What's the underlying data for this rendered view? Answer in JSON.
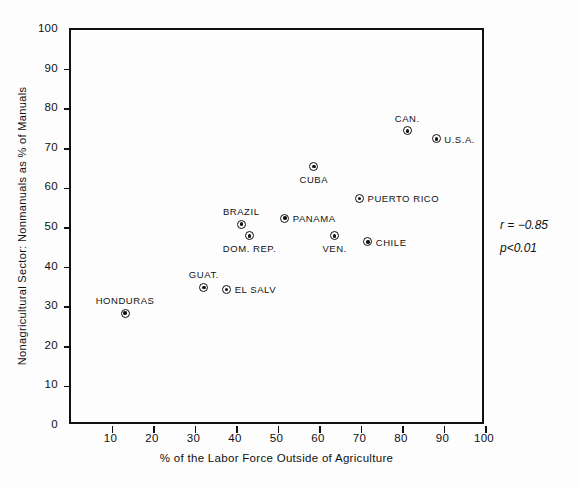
{
  "chart_data": {
    "type": "scatter",
    "title": "",
    "xlabel": "% of the Labor Force Outside of Agriculture",
    "ylabel": "Nonagricultural Sector:  Nonmanuals as % of Manuals",
    "xlim": [
      0,
      100
    ],
    "ylim": [
      0,
      100
    ],
    "xticks": [
      0,
      10,
      20,
      30,
      40,
      50,
      60,
      70,
      80,
      90,
      100
    ],
    "yticks": [
      0,
      10,
      20,
      30,
      40,
      50,
      60,
      70,
      80,
      90,
      100
    ],
    "grid": false,
    "legend": "none",
    "marker_style": "bullseye",
    "points": [
      {
        "label": "HONDURAS",
        "x": 13.5,
        "y": 28,
        "label_pos": "above"
      },
      {
        "label": "GUAT.",
        "x": 32.5,
        "y": 34.5,
        "label_pos": "above"
      },
      {
        "label": "EL SALV",
        "x": 38,
        "y": 34,
        "label_pos": "right"
      },
      {
        "label": "BRAZIL",
        "x": 41.5,
        "y": 50.5,
        "label_pos": "above"
      },
      {
        "label": "DOM. REP.",
        "x": 43.5,
        "y": 47.5,
        "label_pos": "below"
      },
      {
        "label": "PANAMA",
        "x": 52,
        "y": 52,
        "label_pos": "right"
      },
      {
        "label": "CUBA",
        "x": 59,
        "y": 65,
        "label_pos": "below"
      },
      {
        "label": "VEN.",
        "x": 64,
        "y": 47.5,
        "label_pos": "below"
      },
      {
        "label": "CHILE",
        "x": 72,
        "y": 46,
        "label_pos": "right"
      },
      {
        "label": "PUERTO RICO",
        "x": 70,
        "y": 57,
        "label_pos": "right"
      },
      {
        "label": "CAN.",
        "x": 81.5,
        "y": 74,
        "label_pos": "above"
      },
      {
        "label": "U.S.A.",
        "x": 88.5,
        "y": 72,
        "label_pos": "right"
      }
    ],
    "annotations": {
      "correlation": "r = −0.85",
      "significance": "p<0.01"
    }
  }
}
